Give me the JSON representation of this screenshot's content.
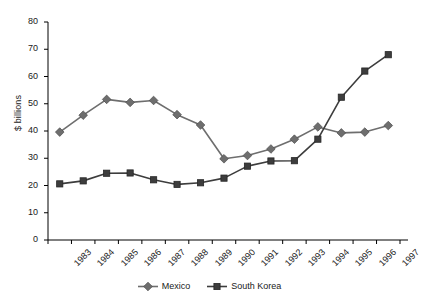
{
  "chart_data": {
    "type": "line",
    "title": "",
    "xlabel": "",
    "ylabel": "$ billions",
    "ylim": [
      0,
      80
    ],
    "ytick_step": 10,
    "yticks": [
      "0",
      "10",
      "20",
      "30",
      "40",
      "50",
      "60",
      "70",
      "80"
    ],
    "grid": false,
    "legend_position": "bottom",
    "categories": [
      "1983",
      "1984",
      "1985",
      "1986",
      "1987",
      "1988",
      "1989",
      "1990",
      "1991",
      "1992",
      "1993",
      "1994",
      "1995",
      "1996",
      "1997"
    ],
    "series": [
      {
        "name": "Mexico",
        "marker": "diamond",
        "color": "#6e6e6e",
        "values": [
          39.6,
          45.8,
          51.6,
          50.5,
          51.2,
          46.0,
          42.2,
          29.8,
          31.0,
          33.4,
          37.0,
          41.5,
          39.3,
          39.6,
          42.0
        ]
      },
      {
        "name": "South Korea",
        "marker": "square",
        "color": "#3d3d3d",
        "values": [
          20.6,
          21.7,
          24.5,
          24.6,
          22.1,
          20.4,
          21.0,
          22.7,
          27.1,
          29.0,
          29.1,
          37.0,
          52.4,
          62.0,
          68.0
        ]
      }
    ]
  },
  "legend": {
    "entries": [
      {
        "label": "Mexico"
      },
      {
        "label": "South Korea"
      }
    ]
  }
}
